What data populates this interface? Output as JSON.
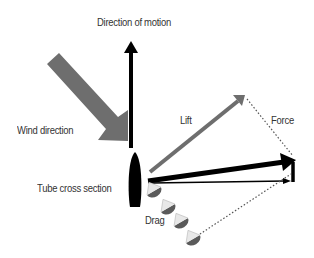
{
  "diagram": {
    "labels": {
      "direction_of_motion": "Direction of motion",
      "wind_direction": "Wind direction",
      "tube_cross_section": "Tube cross section",
      "lift": "Lift",
      "force": "Force",
      "drag": "Drag"
    },
    "colors": {
      "black": "#000000",
      "gray_arrow": "#6e6e6e",
      "text": "#333333",
      "dotted": "#555555"
    },
    "elements": [
      {
        "id": "motion-arrow",
        "type": "arrow",
        "color": "black",
        "from": [
          131,
          148
        ],
        "to": [
          131,
          42
        ]
      },
      {
        "id": "wind-arrow",
        "type": "block-arrow",
        "color": "gray",
        "from": [
          52,
          58
        ],
        "to": [
          128,
          140
        ]
      },
      {
        "id": "tube",
        "type": "ellipse",
        "color": "black",
        "center": [
          135,
          180
        ]
      },
      {
        "id": "lift-arrow",
        "type": "arrow",
        "color": "gray",
        "from": [
          150,
          172
        ],
        "to": [
          244,
          96
        ]
      },
      {
        "id": "force-arrow",
        "type": "arrow",
        "color": "black",
        "from": [
          148,
          181
        ],
        "to": [
          293,
          160
        ]
      },
      {
        "id": "drag-umbrellas",
        "type": "series",
        "count": 4
      }
    ]
  }
}
